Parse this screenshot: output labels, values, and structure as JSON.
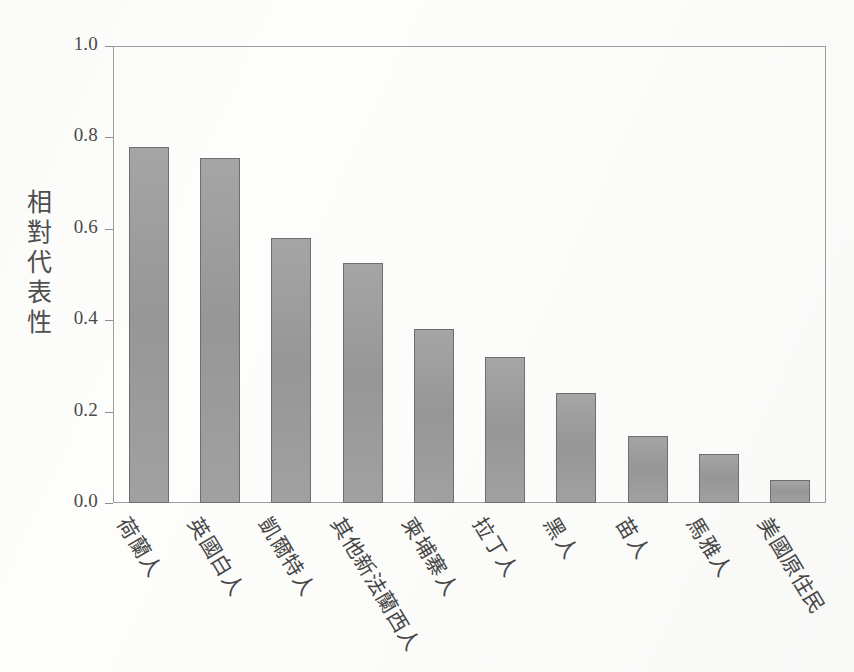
{
  "chart_data": {
    "type": "bar",
    "title": "",
    "subtitle": "",
    "xlabel": "",
    "ylabel": "相對代表性",
    "ylim": [
      0,
      1.0
    ],
    "ytick_labels": [
      "0.0",
      "0.2",
      "0.4",
      "0.6",
      "0.8",
      "1.0"
    ],
    "ytick_values": [
      0.0,
      0.2,
      0.4,
      0.6,
      0.8,
      1.0
    ],
    "grid": false,
    "legend": null,
    "legend_position": "none",
    "categories": [
      "荷蘭人",
      "英國白人",
      "凱爾特人",
      "其他新法蘭西人",
      "柬埔寨人",
      "拉丁人",
      "黑人",
      "苗人",
      "馬雅人",
      "美國原住民"
    ],
    "values": [
      0.78,
      0.755,
      0.58,
      0.525,
      0.38,
      0.32,
      0.24,
      0.147,
      0.107,
      0.05
    ],
    "bar_color": "#9b9b9b",
    "bar_edge_color": "#6e6e6e",
    "axis_color": "#9d9d9d",
    "background_color": "#fdfdfc"
  }
}
